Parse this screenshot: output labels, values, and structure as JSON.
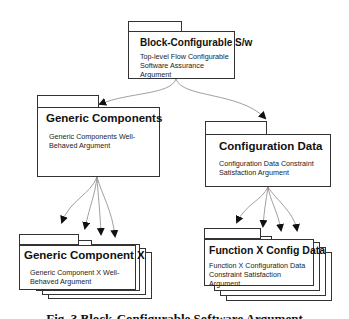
{
  "diagram": {
    "type": "GSN module/package diagram",
    "nodes": [
      {
        "id": "top",
        "title": "Block-Configurable S/w",
        "description": "Top-level Flow Configurable Software Assurance Argument"
      },
      {
        "id": "gc",
        "title": "Generic Components",
        "description": "Generic Components Well-Behaved Argument"
      },
      {
        "id": "cd",
        "title": "Configuration Data",
        "description": "Configuration Data Constraint Satisfaction Argument"
      },
      {
        "id": "gcx",
        "title": "Generic Component X",
        "description": "Generic Component X Well-Behaved Argument",
        "multiple": true
      },
      {
        "id": "fx",
        "title": "Function X Config Data",
        "description": "Function X Configuration Data Constraint Satisfaction Argument",
        "multiple": true
      }
    ],
    "edges": [
      {
        "from": "top",
        "to": "gc"
      },
      {
        "from": "top",
        "to": "cd"
      },
      {
        "from": "gc",
        "to": "gcx",
        "count": 4
      },
      {
        "from": "cd",
        "to": "fx",
        "count": 4
      }
    ],
    "caption": "Fig. 3 (partially visible) Config Ar..."
  },
  "nodes": {
    "top": {
      "title": "Block-Configurable S/w",
      "desc": "Top-level Flow Configurable Software Assurance Argument"
    },
    "gc": {
      "title": "Generic Components",
      "desc": "Generic Components Well-Behaved Argument"
    },
    "cd": {
      "title": "Configuration Data",
      "desc": "Configuration Data Constraint Satisfaction Argument"
    },
    "gcx": {
      "title": "Generic Component X",
      "desc": "Generic Component X Well-Behaved Argument"
    },
    "fx": {
      "title": "Function X Config Data",
      "desc": "Function X Configuration Data Constraint Satisfaction Argument"
    }
  },
  "caption": "Fig. 3  Block-Configurable Software Argument"
}
